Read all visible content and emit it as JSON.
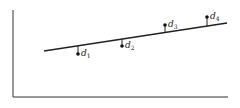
{
  "diagram": {
    "type": "regression-residuals",
    "axes": {
      "origin": [
        13,
        97
      ],
      "x_end": 228,
      "y_top": 10
    },
    "fit_line": {
      "x1": 44,
      "y1": 51,
      "x2": 227,
      "y2": 23
    },
    "points": [
      {
        "label": "d",
        "sub": "1",
        "x": 78,
        "y": 54,
        "line_y": 45.8
      },
      {
        "label": "d",
        "sub": "2",
        "x": 122,
        "y": 46,
        "line_y": 39.1
      },
      {
        "label": "d",
        "sub": "3",
        "x": 165,
        "y": 25,
        "line_y": 32.5
      },
      {
        "label": "d",
        "sub": "4",
        "x": 207,
        "y": 17,
        "line_y": 26.1
      }
    ],
    "colors": {
      "ink": "#222222",
      "background": "#ffffff"
    }
  }
}
